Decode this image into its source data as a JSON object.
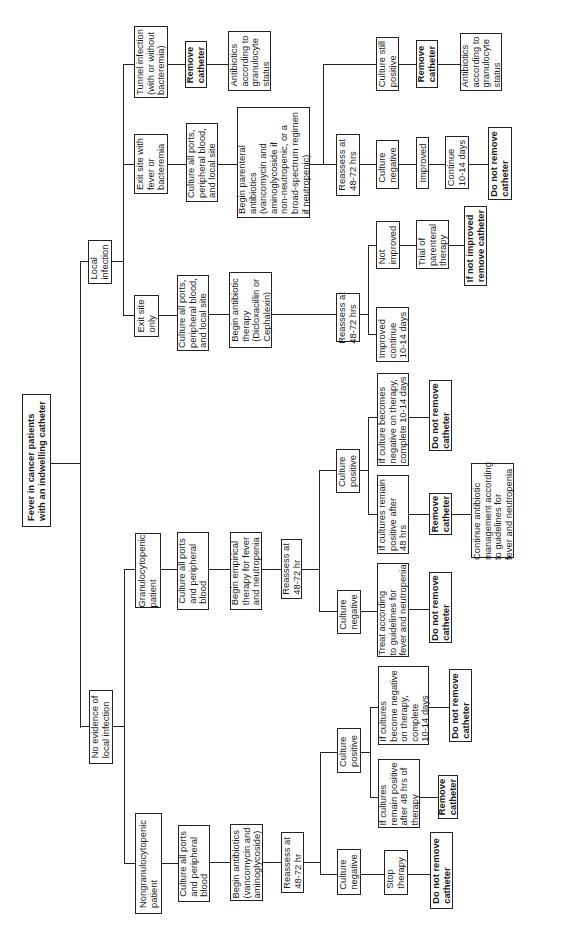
{
  "title": "Fever in cancer patients\nwith an indwelling catheter",
  "branches": {
    "local_infection": {
      "label": "Local\ninfection",
      "tunnel": {
        "label": "Tunnel infection\n(with or without\nbacteremia)",
        "action": "Remove\ncatheter",
        "followup": "Antibiotics\naccording to\ngranulocyte\nstatus"
      },
      "exit_fever": {
        "label": "Exit site with\nfever or\nbacteremia",
        "culture": "Culture all ports,\nperipheral blood,\nand local site",
        "therapy": "Begin parenteral\nantibiotics\n(vancomycin and\naminoglycoside if\nnon-neutropenic, or a\nbroad-spectrum regimen\nif neutropenic)",
        "reassess": "Reassess at\n48-72 hrs",
        "still_positive": {
          "label": "Culture still\npositive",
          "action": "Remove\ncatheter",
          "followup": "Antibiotics\naccording to\ngranulocyte\nstatus"
        },
        "negative": {
          "label": "Culture\nnegative",
          "improved": "Improved",
          "continue": "Continue\n10-14 days",
          "action": "Do not remove\ncatheter"
        }
      },
      "exit_only": {
        "label": "Exit site\nonly",
        "culture": "Culture all ports,\nperipheral blood,\nand local site",
        "therapy": "Begin antibiotic\ntherapy\n(Dicloxacillin or\nCephalexin)",
        "reassess": "Reassess at\n48-72 hrs",
        "not_improved": {
          "label": "Not\nimproved",
          "trial": "Trial of\nparenteral\ntherapy",
          "action": "If not improved\nremove catheter"
        },
        "improved": "Improved\ncontinue\n10-14 days"
      }
    },
    "no_local": {
      "label": "No evidence of\nlocal infection",
      "granulocytopenic": {
        "label": "Granulocytopenic\npatient",
        "culture": "Culture all ports\nand peripheral\nblood",
        "therapy": "Begin empirical\ntherapy for fever\nand neutropenia",
        "reassess": "Reassess at\n48-72 hr",
        "positive": {
          "label": "Culture\npositive",
          "becomes_negative": "If culture becomes\nnegative on therapy,\ncomplete 10-14 days",
          "becomes_negative_action": "Do not remove\ncatheter",
          "remains_positive": "If cultures remain\npositive after\n48 hrs",
          "remains_positive_action": "Remove\ncatheter",
          "remains_positive_followup": "Continue antibiotic\nmanagement according\nto guidelines for\nfever and neutropenia"
        },
        "negative": {
          "label": "Culture\nnegative",
          "treat": "Treat according\nto guidelines for\nfever and neutropenia",
          "action": "Do not remove\ncatheter"
        }
      },
      "nongranulocytopenic": {
        "label": "Nongranulocytopenic\npatient",
        "culture": "Culture all ports\nand peripheral\nblood",
        "therapy": "Begin antibiotics\n(vancomycin and\naminoglycoside)",
        "reassess": "Reassess at\n48-72 hr",
        "positive": {
          "label": "Culture\npositive",
          "becomes_negative": "If cultures\nbecome negative\non therapy,\ncomplete\n10-14 days",
          "becomes_negative_action": "Do not remove\ncatheter",
          "remains_positive": "If cultures\nremain positive\nafter 48 hrs of\ntherapy",
          "remains_positive_action": "Remove\ncatheter"
        },
        "negative": {
          "label": "Culture\nnegative",
          "stop": "Stop\ntherapy",
          "action": "Do not remove\ncatheter"
        }
      }
    }
  }
}
